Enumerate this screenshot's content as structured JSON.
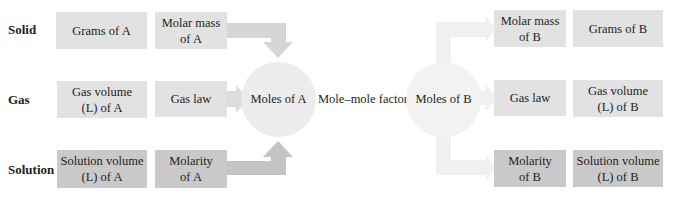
{
  "rows": {
    "solid": "Solid",
    "gas": "Gas",
    "solution": "Solution"
  },
  "left": {
    "grams": "Grams of A",
    "molar_mass": "Molar mass\nof A",
    "gas_volume": "Gas volume\n(L) of A",
    "gas_law": "Gas law",
    "solution_volume": "Solution volume\n(L) of A",
    "molarity": "Molarity\nof A"
  },
  "center": {
    "moles_a": "Moles of A",
    "factor": "Mole–mole factor",
    "moles_b": "Moles of B"
  },
  "right": {
    "molar_mass": "Molar mass\nof B",
    "grams": "Grams of B",
    "gas_law": "Gas law",
    "gas_volume": "Gas volume\n(L) of B",
    "molarity": "Molarity\nof B",
    "solution_volume": "Solution volume\n(L) of B"
  },
  "colors": {
    "box_light": "#e2e2e2",
    "box_dark": "#c9c9c9",
    "circle": "#ececec",
    "arrow_left_top": "#d6d6d6",
    "arrow_left_mid": "#dcdcdc",
    "arrow_left_bottom": "#c4c4c4",
    "arrow_right": "#f0f0f0"
  }
}
